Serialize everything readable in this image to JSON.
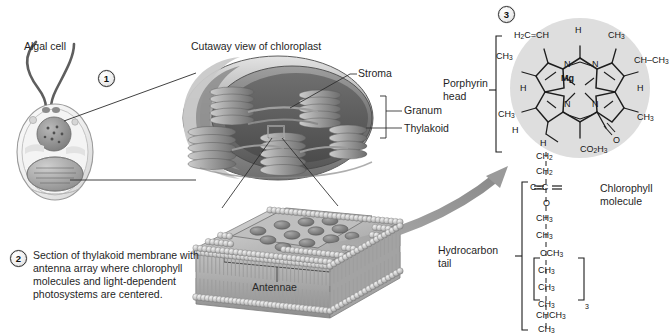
{
  "figure": {
    "background": "#ffffff"
  },
  "markers": {
    "one": "1",
    "two": "2",
    "three": "3"
  },
  "panel1": {
    "algal_cell_label": "Algal cell",
    "chloroplast_title": "Cutaway view of chloroplast",
    "labels": {
      "stroma": "Stroma",
      "granum": "Granum",
      "thylakoid": "Thylakoid"
    }
  },
  "panel2": {
    "caption": "Section of thylakoid membrane with antenna array where chlorophyll molecules and light-dependent photosystems are centered.",
    "antennae_label": "Antennae"
  },
  "panel3": {
    "porphyrin_label": "Porphyrin head",
    "porphyrin_label_line1": "Porphyrin",
    "porphyrin_label_line2": "head",
    "hydrocarbon_label_line1": "Hydrocarbon",
    "hydrocarbon_label_line2": "tail",
    "molecule_name_line1": "Chlorophyll",
    "molecule_name_line2": "molecule",
    "center_atom": "Mg",
    "ring_nitrogens": [
      "N",
      "N",
      "N",
      "N"
    ],
    "ring_substituents": {
      "vinyl": "H2C=CH",
      "top_h": "H",
      "top_right_ch3": "CH3",
      "left_ch3": "CH3",
      "right_ch_ch3": "CH-CH3",
      "left_h": "H",
      "right_h": "H",
      "lower_left_ch3": "CH3",
      "lower_left_h": "H",
      "lower_right_ch3": "CH3",
      "bottom_h": "H",
      "carbonyl_o": "O",
      "ester": "CO2H3"
    },
    "tail_chain": [
      "CH2",
      "CH2",
      "C=C",
      "O",
      "CH3",
      "CH3",
      "CCH3",
      "CH3",
      "CH3",
      "CH3",
      "CHCH3",
      "CH3"
    ],
    "tail_repeat_subscript": "3"
  },
  "colors": {
    "ink": "#1f1f1f",
    "arrow_gray": "#9a9a9a",
    "disc_gray": "#dcdcdc",
    "membrane_gray": "#b9b9b9",
    "leader_line": "#2b2b2b"
  }
}
